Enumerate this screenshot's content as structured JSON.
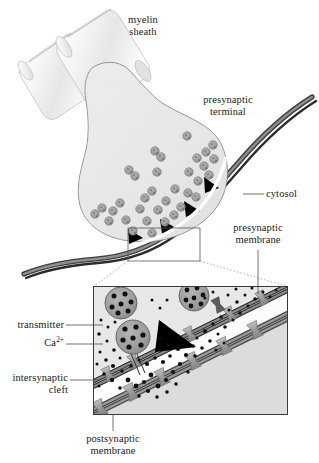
{
  "figure": {
    "labels": {
      "myelin_sheath": "myelin\nsheath",
      "presynaptic_terminal": "presynaptic\nterminal",
      "cytosol": "cytosol",
      "presynaptic_membrane": "presynaptic\nmembrane",
      "transmitter": "transmitter",
      "calcium_ion": "Ca",
      "calcium_ion_charge": "2+",
      "intersynaptic_cleft": "intersynaptic\ncleft",
      "postsynaptic_membrane": "postsynaptic\nmembrane"
    },
    "colors": {
      "outline": "#4d4d4d",
      "terminal_fill": "#e8e8e8",
      "myelin_fill": "#f2f2f2",
      "membrane_dark": "#3a3a3a",
      "membrane_gray": "#8c8c8c",
      "receptor_gray": "#9e9e9e",
      "vesicle_gray": "#9a9a9a",
      "active_zone": "#000000",
      "text": "#1a1a1a",
      "inset_bg": "#f0f0f0",
      "leader_line": "#4d4d4d"
    },
    "structures": {
      "vesicle_count_terminal": 34,
      "active_zone_count_terminal": 4,
      "inset_vesicle_count": 3,
      "inset_receptor_count": 11,
      "transmitter_dot_count": 96
    }
  }
}
